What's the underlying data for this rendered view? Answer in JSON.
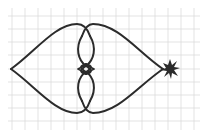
{
  "diagram": {
    "background": "#ffffff",
    "grid_color": "#d9d9d9",
    "stroke_color": "#2b2b2b",
    "grid": {
      "x_lines": [
        12,
        25,
        38,
        51,
        64,
        77,
        90,
        103,
        116,
        129,
        142,
        155,
        168,
        181,
        194
      ],
      "y_lines": [
        16,
        29,
        42,
        55,
        69,
        82,
        95,
        108,
        121
      ]
    },
    "points": {
      "left_tip": [
        11,
        69
      ],
      "right_tip": [
        163,
        69
      ],
      "star_center": [
        170,
        69
      ]
    },
    "star": {
      "name": "star-burst",
      "rays": 10
    }
  }
}
